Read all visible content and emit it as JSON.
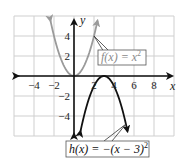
{
  "chart_data": {
    "type": "line",
    "title": "",
    "xlabel": "x",
    "ylabel": "y",
    "xlim": [
      -6,
      10
    ],
    "ylim": [
      -6,
      6
    ],
    "grid": true,
    "grid_step": 2,
    "x_ticks": [
      "−4",
      "−2",
      "2",
      "4",
      "6",
      "8"
    ],
    "y_ticks": [
      "4",
      "2",
      "−2",
      "−4"
    ],
    "series": [
      {
        "name": "f(x) = x^2",
        "label": "f(x) = x²",
        "color": "#9a9a9a",
        "equation": "x^2",
        "x": [
          -2.4,
          -2,
          -1,
          0,
          1,
          2,
          2.4
        ],
        "y": [
          5.76,
          4,
          1,
          0,
          1,
          4,
          5.76
        ]
      },
      {
        "name": "h(x) = -(x-3)^2",
        "label": "h(x) = −(x − 3)²",
        "color": "#111111",
        "equation": "-(x-3)^2",
        "x": [
          0.6,
          1,
          2,
          3,
          4,
          5,
          5.4
        ],
        "y": [
          -5.76,
          -4,
          -1,
          0,
          -1,
          -4,
          -5.76
        ]
      }
    ]
  },
  "labels": {
    "x_axis": "x",
    "y_axis": "y",
    "f_label_prefix": "f(x) = x",
    "f_label_exp": "2",
    "h_label_prefix": "h(x) = −(x − 3)",
    "h_label_exp": "2"
  },
  "ticks": {
    "x": [
      {
        "value": -4,
        "text": "−4"
      },
      {
        "value": -2,
        "text": "−2"
      },
      {
        "value": 2,
        "text": "2"
      },
      {
        "value": 4,
        "text": "4"
      },
      {
        "value": 6,
        "text": "6"
      },
      {
        "value": 8,
        "text": "8"
      }
    ],
    "y": [
      {
        "value": 4,
        "text": "4"
      },
      {
        "value": 2,
        "text": "2"
      },
      {
        "value": -2,
        "text": "−2"
      },
      {
        "value": -4,
        "text": "−4"
      }
    ]
  }
}
